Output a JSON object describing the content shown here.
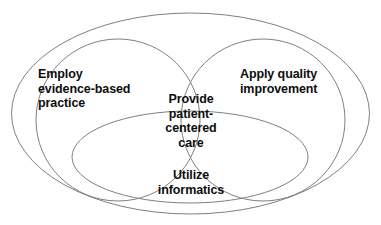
{
  "diagram": {
    "type": "venn",
    "background_color": "#ffffff",
    "stroke_color": "#7f7f7f",
    "text_color": "#0d0d0d",
    "sets": [
      {
        "id": "evidence",
        "label": "Employ\nevidence-based\npractice",
        "shape": "circle",
        "position": "left"
      },
      {
        "id": "quality",
        "label": "Apply quality\nimprovement",
        "shape": "circle",
        "position": "right"
      },
      {
        "id": "informatics",
        "label": "Utilize\ninformatics",
        "shape": "ellipse",
        "position": "bottom"
      }
    ],
    "intersection": {
      "id": "center",
      "label": "Provide\npatient-\ncentered\ncare"
    },
    "container": {
      "id": "outer",
      "label": "",
      "shape": "ellipse"
    }
  }
}
